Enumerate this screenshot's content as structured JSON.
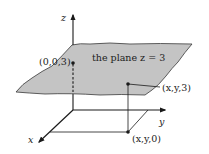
{
  "diagram": {
    "type": "3d-coordinate-plane",
    "colors": {
      "plane_fill": "#c4c4c4",
      "line": "#1a1a1a",
      "background": "#ffffff"
    },
    "axes": {
      "x_label": "x",
      "y_label": "y",
      "z_label": "z"
    },
    "plane_label": "the plane z = 3",
    "points": [
      {
        "name": "z-intercept",
        "label": "(0,0,3)"
      },
      {
        "name": "point-on-plane",
        "label": "(x,y,3)"
      },
      {
        "name": "projection-on-xy",
        "label": "(x,y,0)"
      }
    ]
  }
}
